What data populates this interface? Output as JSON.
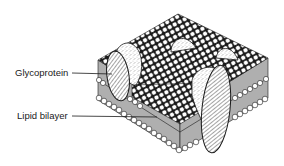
{
  "diagram": {
    "labels": [
      {
        "id": "glycoprotein",
        "text": "Glycoprotein"
      },
      {
        "id": "lipid-bilayer",
        "text": "Lipid bilayer"
      }
    ],
    "colors": {
      "ink": "#1a1a1a",
      "background": "#ffffff"
    }
  }
}
